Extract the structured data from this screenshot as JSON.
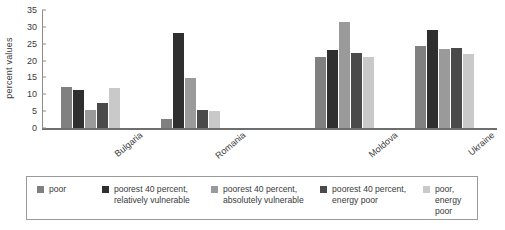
{
  "chart_data": {
    "type": "bar",
    "title": "",
    "xlabel": "",
    "ylabel": "percent values",
    "ylim": [
      0,
      35
    ],
    "ytick_step": 5,
    "yticks": [
      0,
      5,
      10,
      15,
      20,
      25,
      30,
      35
    ],
    "grid": false,
    "legend_position": "bottom",
    "categories": [
      "Bulgaria",
      "Romania",
      "Moldova",
      "Ukraine"
    ],
    "series": [
      {
        "name": "poor",
        "color": "#808080",
        "values": [
          12.3,
          2.7,
          21.0,
          24.3
        ]
      },
      {
        "name": "poorest 40 percent, relatively vulnerable",
        "color": "#2f2f2f",
        "values": [
          11.2,
          28.2,
          23.1,
          29.2
        ]
      },
      {
        "name": "poorest 40 percent, absolutely vulnerable",
        "color": "#9a9a9a",
        "values": [
          5.2,
          14.7,
          31.5,
          23.4
        ]
      },
      {
        "name": "poorest 40 percent, energy poor",
        "color": "#4a4a4a",
        "values": [
          7.4,
          5.4,
          22.2,
          23.7
        ]
      },
      {
        "name": "poor, energy poor",
        "color": "#c9c9c9",
        "values": [
          11.9,
          4.9,
          21.2,
          22.0
        ]
      }
    ]
  },
  "axis": {
    "ylabel": "percent values",
    "tick_labels": [
      "35",
      "30",
      "25",
      "20",
      "15",
      "10",
      "5",
      "0"
    ]
  },
  "legend": {
    "items": [
      {
        "label": "poor",
        "color": "#808080"
      },
      {
        "label": "poorest 40 percent, relatively vulnerable",
        "color": "#2f2f2f"
      },
      {
        "label": "poorest 40 percent, absolutely vulnerable",
        "color": "#9a9a9a"
      },
      {
        "label": "poorest 40 percent, energy poor",
        "color": "#4a4a4a"
      },
      {
        "label": "poor, energy poor",
        "color": "#c9c9c9"
      }
    ]
  }
}
